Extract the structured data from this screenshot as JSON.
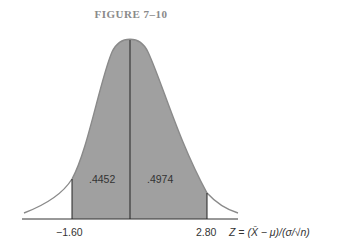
{
  "figure": {
    "title": "FIGURE 7–10",
    "areas": {
      "left": ".4452",
      "right": ".4974"
    },
    "ticks": {
      "left": "−1.60",
      "right": "2.80"
    },
    "axis_label": "Z = (X̄ − μ)/(σ/√n)",
    "colors": {
      "fill": "#a0a0a0",
      "curve": "#8a8a8a",
      "line": "#333333"
    }
  }
}
